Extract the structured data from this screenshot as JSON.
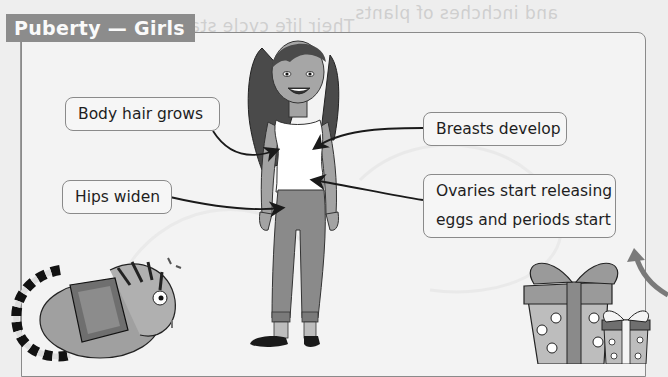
{
  "page": {
    "title": "Puberty — Girls",
    "colors": {
      "title_bg": "#8c8c8c",
      "title_text": "#fafafa",
      "panel_bg": "#f3f3f3",
      "panel_border": "#8a8a8a",
      "label_text": "#1e1e1e"
    }
  },
  "labels": [
    {
      "id": "body-hair",
      "text": "Body hair grows"
    },
    {
      "id": "hips",
      "text": "Hips widen"
    },
    {
      "id": "breasts",
      "text": "Breasts develop"
    },
    {
      "id": "ovaries",
      "line1": "Ovaries start releasing",
      "line2": "eggs and periods start"
    }
  ],
  "bleed_through": {
    "line1": "and inchches of plants",
    "line2": "Their life cycle starts",
    "line3": "begins as a seed in water"
  },
  "illustrations": {
    "figure": "girl-figure",
    "bottom_left": "tiger-reading-book",
    "bottom_right": "gift-boxes"
  }
}
